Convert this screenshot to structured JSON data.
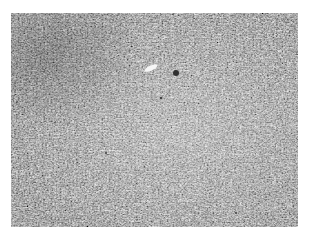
{
  "image": {
    "description": "Grayscale histology micrograph of densely packed spindle-shaped cells",
    "colors": {
      "background": "#ffffff",
      "tissue_base": "#c8c8c8",
      "dark_nuclei": "#303030",
      "light_vessel": "#f4f4f4"
    },
    "features": [
      {
        "name": "dark-cell-cluster",
        "x": 176,
        "y": 73
      },
      {
        "name": "vascular-lumen",
        "x": 152,
        "y": 66
      },
      {
        "name": "dark-dense-region",
        "x": 40,
        "y": 50
      }
    ]
  }
}
